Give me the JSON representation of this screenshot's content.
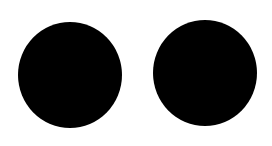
{
  "canvas": {
    "background": "#ffffff",
    "width": 272,
    "height": 146
  },
  "shapes": [
    {
      "type": "circle",
      "fill": "#000000",
      "cx": 70,
      "cy": 75,
      "rx": 52,
      "ry": 53
    },
    {
      "type": "circle",
      "fill": "#000000",
      "cx": 205,
      "cy": 73,
      "rx": 52,
      "ry": 53
    }
  ]
}
